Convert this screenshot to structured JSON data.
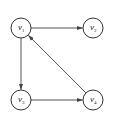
{
  "diagram": {
    "type": "directed-graph",
    "nodes": [
      {
        "id": "v1",
        "base": "v",
        "sub": "1",
        "x": 21,
        "y": 28
      },
      {
        "id": "v2",
        "base": "v",
        "sub": "2",
        "x": 93,
        "y": 28
      },
      {
        "id": "v3",
        "base": "v",
        "sub": "3",
        "x": 21,
        "y": 100
      },
      {
        "id": "v4",
        "base": "v",
        "sub": "4",
        "x": 93,
        "y": 100
      }
    ],
    "edges": [
      {
        "from": "v1",
        "to": "v2"
      },
      {
        "from": "v1",
        "to": "v3"
      },
      {
        "from": "v3",
        "to": "v4"
      },
      {
        "from": "v4",
        "to": "v1"
      }
    ],
    "node_radius": 10,
    "stroke_color": "#333333",
    "edge_color": "#444444"
  }
}
